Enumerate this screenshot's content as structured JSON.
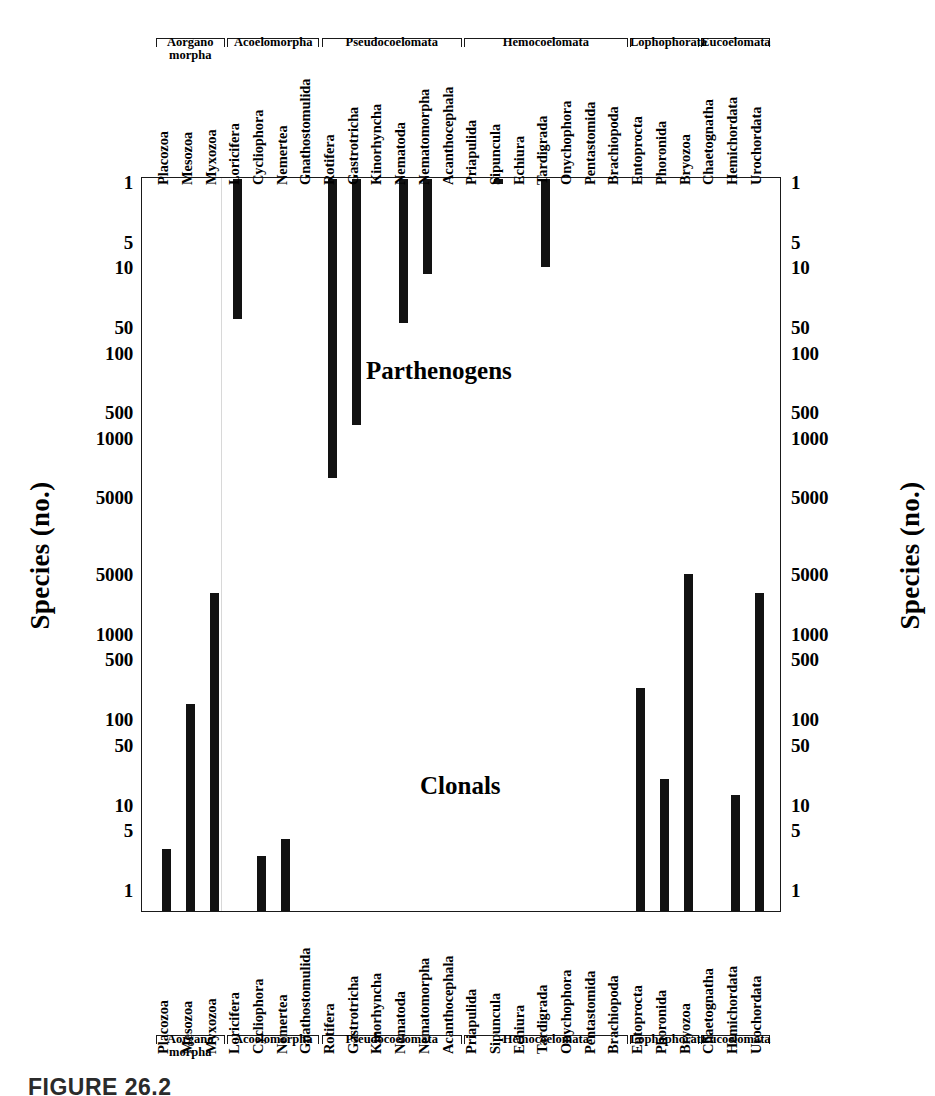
{
  "caption": "FIGURE 26.2",
  "axis": {
    "ylabel_left": "Species (no.)",
    "ylabel_right": "Species (no.)"
  },
  "regions": {
    "upper_label": "Parthenogens",
    "lower_label": "Clonals"
  },
  "taxa": [
    "Placozoa",
    "Mesozoa",
    "Myxozoa",
    "Loricifera",
    "Cycliophora",
    "Nemertea",
    "Gnathostomulida",
    "Rotifera",
    "Gastrotricha",
    "Kinorhyncha",
    "Nematoda",
    "Nematomorpha",
    "Acanthocephala",
    "Priapulida",
    "Sipuncula",
    "Echiura",
    "Tardigrada",
    "Onychophora",
    "Pentastomida",
    "Brachiopoda",
    "Entoprocta",
    "Phoronida",
    "Bryozoa",
    "Chaetognatha",
    "Hemichordata",
    "Urochordata"
  ],
  "groups": [
    {
      "label": "Aorgano\nmorpha",
      "start": 0,
      "end": 2
    },
    {
      "label": "Acoelomorpha",
      "start": 3,
      "end": 6
    },
    {
      "label": "Pseudocoelomata",
      "start": 7,
      "end": 12
    },
    {
      "label": "Hemocoelomata",
      "start": 13,
      "end": 19
    },
    {
      "label": "Lophophorata",
      "start": 20,
      "end": 22
    },
    {
      "label": "Eucoelomata",
      "start": 23,
      "end": 25
    }
  ],
  "ticks_upper": [
    "1",
    "5",
    "10",
    "50",
    "100",
    "500",
    "1000",
    "5000"
  ],
  "ticks_lower": [
    "5000",
    "1000",
    "500",
    "100",
    "50",
    "10",
    "5",
    "1"
  ],
  "chart_data": {
    "type": "bar",
    "title": "FIGURE 26.2",
    "xlabel": "",
    "ylabel": "Species (no.)",
    "orientation": "back-to-back vertical bars, log scale",
    "ylim_upper": [
      1,
      10000
    ],
    "ylim_lower": [
      1,
      10000
    ],
    "grid": false,
    "legend": "none",
    "categories": [
      "Placozoa",
      "Mesozoa",
      "Myxozoa",
      "Loricifera",
      "Cycliophora",
      "Nemertea",
      "Gnathostomulida",
      "Rotifera",
      "Gastrotricha",
      "Kinorhyncha",
      "Nematoda",
      "Nematomorpha",
      "Acanthocephala",
      "Priapulida",
      "Sipuncula",
      "Echiura",
      "Tardigrada",
      "Onychophora",
      "Pentastomida",
      "Brachiopoda",
      "Entoprocta",
      "Phoronida",
      "Bryozoa",
      "Chaetognatha",
      "Hemichordata",
      "Urochordata"
    ],
    "series": [
      {
        "name": "Parthenogens",
        "direction": "down-from-top",
        "axis_ticks": [
          "1",
          "5",
          "10",
          "50",
          "100",
          "500",
          "1000",
          "5000"
        ],
        "values": [
          0,
          0,
          0,
          40,
          0,
          0,
          0,
          3000,
          700,
          0,
          45,
          12,
          0,
          0,
          1,
          0,
          10,
          0,
          0,
          0,
          0,
          0,
          0,
          0,
          0,
          0
        ]
      },
      {
        "name": "Clonals",
        "direction": "up-from-bottom",
        "axis_ticks": [
          "5000",
          "1000",
          "500",
          "100",
          "50",
          "10",
          "5",
          "1"
        ],
        "values": [
          3,
          150,
          3000,
          0,
          2.5,
          4,
          0,
          0,
          0,
          0,
          0,
          0,
          0,
          0,
          0,
          0,
          0,
          0,
          0,
          0,
          230,
          20,
          5000,
          0,
          13,
          3000
        ]
      }
    ]
  }
}
